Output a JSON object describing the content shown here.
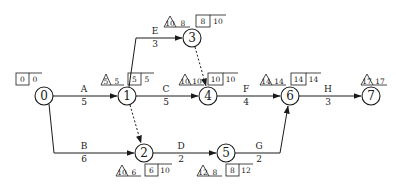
{
  "diagram": {
    "type": "activity-on-arrow network (CPM)",
    "nodes": [
      {
        "id": "0",
        "label": "0",
        "x": 44,
        "y": 96,
        "box": [
          "0",
          "0"
        ]
      },
      {
        "id": "1",
        "label": "1",
        "x": 127,
        "y": 96,
        "tri": "5",
        "triVal": "5",
        "box": [
          "5",
          "5"
        ]
      },
      {
        "id": "2",
        "label": "2",
        "x": 144,
        "y": 153,
        "tri": "10",
        "triVal": "6",
        "box": [
          "6",
          "10"
        ]
      },
      {
        "id": "3",
        "label": "3",
        "x": 192,
        "y": 38,
        "tri": "10",
        "triVal": "8",
        "box": [
          "8",
          "10"
        ]
      },
      {
        "id": "4",
        "label": "4",
        "x": 208,
        "y": 96,
        "tri": "10",
        "triVal": "10",
        "box": [
          "10",
          "10"
        ]
      },
      {
        "id": "5",
        "label": "5",
        "x": 226,
        "y": 153,
        "tri": "12",
        "triVal": "8",
        "box": [
          "8",
          "12"
        ]
      },
      {
        "id": "6",
        "label": "6",
        "x": 290,
        "y": 96,
        "tri": "14",
        "triVal": "14",
        "box": [
          "14",
          "14"
        ]
      },
      {
        "id": "7",
        "label": "7",
        "x": 371,
        "y": 96,
        "tri": "17",
        "triVal": "17"
      }
    ],
    "activities": [
      {
        "name": "A",
        "duration": "5",
        "from": "0",
        "to": "1"
      },
      {
        "name": "B",
        "duration": "6",
        "from": "0",
        "to": "2"
      },
      {
        "name": "C",
        "duration": "5",
        "from": "1",
        "to": "4"
      },
      {
        "name": "D",
        "duration": "2",
        "from": "2",
        "to": "5"
      },
      {
        "name": "E",
        "duration": "3",
        "from": "1",
        "to": "3"
      },
      {
        "name": "F",
        "duration": "4",
        "from": "4",
        "to": "6"
      },
      {
        "name": "G",
        "duration": "2",
        "from": "5",
        "to": "6"
      },
      {
        "name": "H",
        "duration": "3",
        "from": "6",
        "to": "7"
      }
    ],
    "dummies": [
      {
        "from": "1",
        "to": "2"
      },
      {
        "from": "3",
        "to": "4"
      }
    ]
  }
}
